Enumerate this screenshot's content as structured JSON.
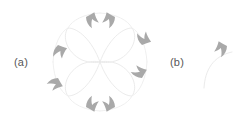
{
  "figure": {
    "width": 247,
    "height": 127,
    "background_color": "#ffffff",
    "panels": [
      {
        "id": "a",
        "label": "(a)",
        "label_position": {
          "x": 14,
          "y": 57
        },
        "description": "quatrefoil rose curve with eight directional arrowheads"
      },
      {
        "id": "b",
        "label": "(b)",
        "label_position": {
          "x": 170,
          "y": 57
        },
        "description": "single arc unit with one directional arrowhead"
      }
    ]
  },
  "colors": {
    "arrowhead_gray": "#a9a9a9",
    "curve_light_gray": "#e9e9e9",
    "outer_arc_gray": "#ededed",
    "unit_arc_gray": "#ebebeb",
    "label_text": "#575757",
    "background": "#ffffff"
  },
  "chart_data": {
    "type": "scatter",
    "title": "",
    "subtitle": "",
    "xlabel": "",
    "ylabel": "",
    "grid": false,
    "legend_position": "none",
    "annotations": [
      "(a)",
      "(b)"
    ],
    "panel_a": {
      "center": {
        "x": 100,
        "y": 62
      },
      "petal_count": 4,
      "petal_radius": 30,
      "petal_angles_deg": [
        45,
        135,
        225,
        315
      ],
      "outer_arc_count": 4,
      "outer_arc_radius": 46,
      "arrowhead_count": 8,
      "arrowheads": [
        {
          "index": 1,
          "x": 86,
          "y": 17,
          "rotation_deg": 200,
          "region": "top-left"
        },
        {
          "index": 2,
          "x": 112,
          "y": 17,
          "rotation_deg": 160,
          "region": "top-right"
        },
        {
          "index": 3,
          "x": 55,
          "y": 48,
          "rotation_deg": 250,
          "region": "left-upper"
        },
        {
          "index": 4,
          "x": 55,
          "y": 76,
          "rotation_deg": 290,
          "region": "left-lower"
        },
        {
          "index": 5,
          "x": 144,
          "y": 48,
          "rotation_deg": 110,
          "region": "right-upper"
        },
        {
          "index": 6,
          "x": 144,
          "y": 76,
          "rotation_deg": 70,
          "region": "right-lower"
        },
        {
          "index": 7,
          "x": 86,
          "y": 108,
          "rotation_deg": 340,
          "region": "bottom-left"
        },
        {
          "index": 8,
          "x": 112,
          "y": 108,
          "rotation_deg": 20,
          "region": "bottom-right"
        }
      ]
    },
    "panel_b": {
      "arc_start": {
        "x": 204,
        "y": 86
      },
      "arc_end": {
        "x": 231,
        "y": 52
      },
      "arc_radius": 34,
      "arrowhead": {
        "x": 215,
        "y": 47,
        "rotation_deg": 160
      },
      "arrowhead_count": 1
    }
  }
}
